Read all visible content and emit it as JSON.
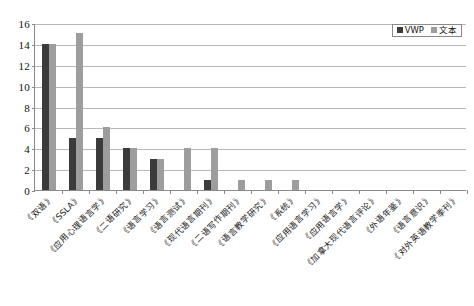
{
  "chart_data": {
    "type": "bar",
    "title": "",
    "subtitle": "",
    "xlabel": "",
    "ylabel": "",
    "ylim": [
      0,
      16
    ],
    "ytick_step": 2,
    "yticks": [
      "16",
      "14",
      "12",
      "10",
      "8",
      "6",
      "4",
      "2",
      "0"
    ],
    "grid": true,
    "legend_position": "top-right",
    "categories": [
      "《双语》",
      "《SSLA》",
      "《应用心理语言学》",
      "《二语研究》",
      "《语言学习》",
      "《语言测试》",
      "《现代语言期刊》",
      "《二语写作期刊》",
      "《语言教学研究》",
      "《系统》",
      "《应用语言学习》",
      "《应用语言学》",
      "《加拿大现代语言评论》",
      "《外语年鉴》",
      "《语言意识》",
      "《对外英语教学季刊》"
    ],
    "series": [
      {
        "name": "VWP",
        "color": "#3b3b3b",
        "values": [
          14,
          5,
          5,
          4,
          3,
          0,
          1,
          0,
          0,
          0,
          0,
          0,
          0,
          0,
          0,
          0
        ]
      },
      {
        "name": "文本",
        "color": "#9d9d9d",
        "values": [
          14,
          15,
          6,
          4,
          3,
          4,
          4,
          1,
          1,
          1,
          0,
          0,
          0,
          0,
          0,
          0
        ]
      }
    ]
  },
  "legend": {
    "items": [
      {
        "label": "VWP",
        "color": "#3b3b3b"
      },
      {
        "label": "文本",
        "color": "#9d9d9d"
      }
    ]
  },
  "colors": {
    "series_vwp": "#3b3b3b",
    "series_text": "#9d9d9d",
    "gridline": "#b9b9b9",
    "axis": "#8a8a8a",
    "background": "#ffffff"
  }
}
